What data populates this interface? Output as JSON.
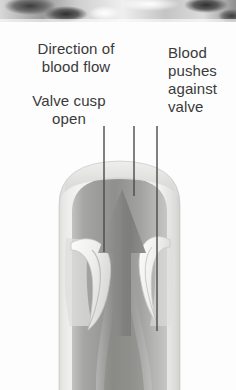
{
  "figure": {
    "background_color": "#fdfdfd",
    "text_color": "#3a3a3a"
  },
  "photo_strip": {
    "name": "grayscale-photo-fragment",
    "description": "cropped grayscale photographic band",
    "height_px": 22
  },
  "labels": {
    "direction": "Direction of\nblood flow",
    "valve_cusp": "Valve cusp\nopen",
    "blood_pushes": "Blood\npushes\nagainst\nvalve"
  },
  "leader_lines": [
    {
      "name": "leader-valve-cusp",
      "x": 104,
      "y_top": 126,
      "y_bottom": 252
    },
    {
      "name": "leader-direction",
      "x": 134,
      "y_top": 126,
      "y_bottom": 196
    },
    {
      "name": "leader-blood-pushes",
      "x": 157,
      "y_top": 126,
      "y_bottom": 331
    }
  ],
  "diagram": {
    "vessel": {
      "name": "vein-wall",
      "left_edge_x": 59,
      "right_edge_x": 180,
      "top_y": 160,
      "bottom_y": 390,
      "wall_color": "#e8e8e6",
      "wall_shadow_color": "#bdbdbb"
    },
    "lumen": {
      "name": "vein-lumen",
      "color": "#9e9e9c"
    },
    "arrow": {
      "name": "blood-flow-arrow",
      "direction": "up",
      "tip_y": 190,
      "base_y": 330,
      "center_x": 122,
      "color": "#8e8e8c"
    },
    "cusps": [
      {
        "name": "valve-cusp-left",
        "side": "left",
        "state": "open"
      },
      {
        "name": "valve-cusp-right",
        "side": "right",
        "state": "open"
      }
    ]
  }
}
